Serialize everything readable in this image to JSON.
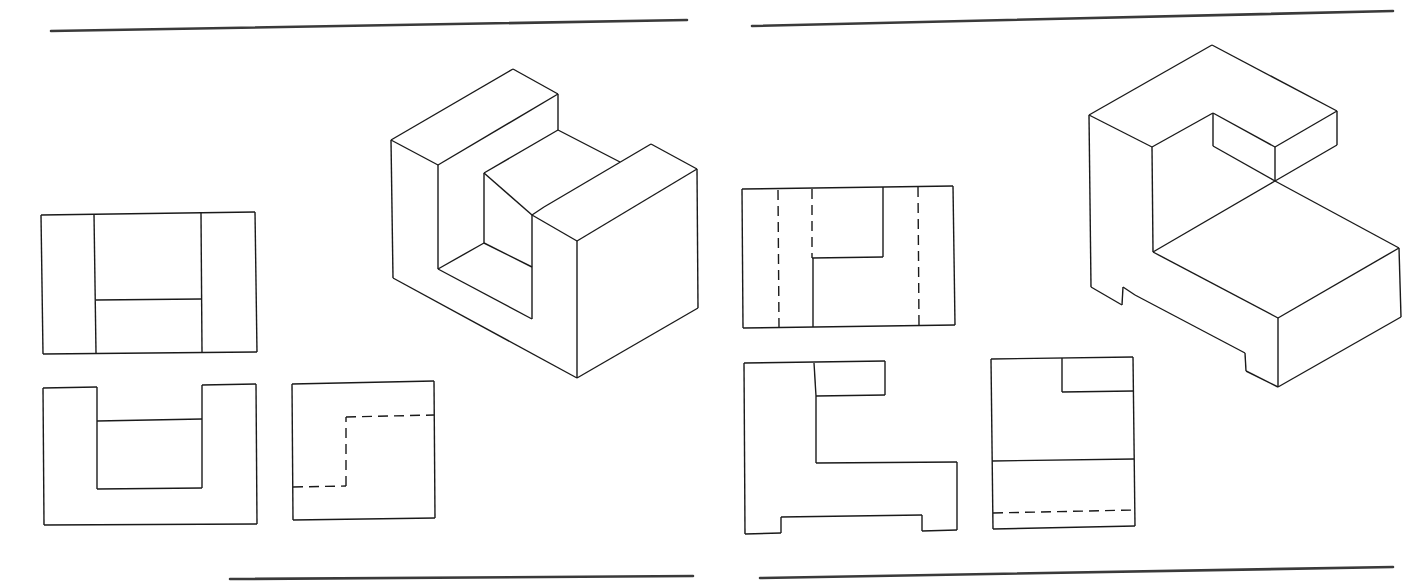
{
  "page": {
    "background": "#ffffff",
    "line_color": "#1a1a1a",
    "rule_color": "#3a3a3a"
  },
  "diagram": {
    "panels": [
      {
        "id": "left",
        "label": "Object 1 (U-shaped block)",
        "rules": {
          "top": {
            "x1": 51,
            "y1": 31,
            "x2": 687,
            "y2": 20
          },
          "bottom": {
            "x1": 230,
            "y1": 579,
            "x2": 693,
            "y2": 576
          }
        },
        "isometric": {
          "label": "Isometric view",
          "edges": [
            [
              391,
              140,
              513,
              69
            ],
            [
              513,
              69,
              558,
              94
            ],
            [
              558,
              94,
              438,
              165
            ],
            [
              438,
              165,
              391,
              140
            ],
            [
              391,
              140,
              393,
              278
            ],
            [
              438,
              165,
              438,
              269
            ],
            [
              558,
              94,
              558,
              130
            ],
            [
              558,
              130,
              484,
              173
            ],
            [
              484,
              173,
              484,
              243
            ],
            [
              558,
              130,
              620,
              162
            ],
            [
              484,
              173,
              532,
              215
            ],
            [
              532,
              215,
              544,
              207
            ],
            [
              544,
              207,
              651,
              144
            ],
            [
              651,
              144,
              697,
              169
            ],
            [
              697,
              169,
              577,
              241
            ],
            [
              577,
              241,
              532,
              215
            ],
            [
              697,
              169,
              698,
              308
            ],
            [
              698,
              308,
              577,
              378
            ],
            [
              577,
              378,
              577,
              241
            ],
            [
              577,
              378,
              393,
              278
            ],
            [
              532,
              215,
              532,
              319
            ],
            [
              438,
              269,
              484,
              243
            ],
            [
              484,
              243,
              532,
              267
            ],
            [
              438,
              269,
              532,
              319
            ]
          ],
          "hidden_edges": []
        },
        "views": [
          {
            "name": "top-view",
            "label": "Top view",
            "edges": [
              [
                41,
                215,
                255,
                212
              ],
              [
                255,
                212,
                257,
                352
              ],
              [
                257,
                352,
                43,
                354
              ],
              [
                43,
                354,
                41,
                215
              ],
              [
                94,
                214,
                96,
                353
              ],
              [
                201,
                213,
                202,
                352
              ],
              [
                96,
                300,
                201,
                299
              ]
            ],
            "hidden_edges": []
          },
          {
            "name": "front-view",
            "label": "Front view",
            "edges": [
              [
                43,
                388,
                97,
                387
              ],
              [
                97,
                387,
                97,
                489
              ],
              [
                97,
                489,
                202,
                488
              ],
              [
                202,
                488,
                202,
                385
              ],
              [
                202,
                385,
                256,
                384
              ],
              [
                256,
                384,
                257,
                524
              ],
              [
                257,
                524,
                44,
                525
              ],
              [
                44,
                525,
                43,
                388
              ],
              [
                97,
                421,
                202,
                419
              ]
            ],
            "hidden_edges": []
          },
          {
            "name": "side-view",
            "label": "Right side view",
            "edges": [
              [
                292,
                384,
                434,
                381
              ],
              [
                434,
                381,
                435,
                518
              ],
              [
                435,
                518,
                293,
                520
              ],
              [
                293,
                520,
                292,
                384
              ]
            ],
            "hidden_edges": [
              [
                293,
                487,
                346,
                486
              ],
              [
                346,
                486,
                346,
                417
              ],
              [
                346,
                417,
                434,
                415
              ]
            ]
          }
        ]
      },
      {
        "id": "right",
        "label": "Object 2 (L-shaped block with base notches)",
        "rules": {
          "top": {
            "x1": 752,
            "y1": 26,
            "x2": 1393,
            "y2": 11
          },
          "bottom": {
            "x1": 760,
            "y1": 578,
            "x2": 1393,
            "y2": 567
          }
        },
        "isometric": {
          "label": "Isometric view",
          "edges": [
            [
              1089,
              115,
              1212,
              45
            ],
            [
              1212,
              45,
              1337,
              111
            ],
            [
              1337,
              111,
              1275,
              147
            ],
            [
              1275,
              147,
              1213,
              113
            ],
            [
              1213,
              113,
              1152,
              147
            ],
            [
              1152,
              147,
              1089,
              115
            ],
            [
              1213,
              113,
              1213,
              146
            ],
            [
              1213,
              146,
              1275,
              181
            ],
            [
              1275,
              147,
              1275,
              181
            ],
            [
              1337,
              111,
              1337,
              145
            ],
            [
              1337,
              145,
              1275,
              181
            ],
            [
              1152,
              147,
              1153,
              252
            ],
            [
              1153,
              252,
              1275,
              181
            ],
            [
              1275,
              181,
              1399,
              248
            ],
            [
              1399,
              248,
              1278,
              318
            ],
            [
              1278,
              318,
              1153,
              252
            ],
            [
              1399,
              248,
              1401,
              317
            ],
            [
              1401,
              317,
              1278,
              387
            ],
            [
              1278,
              318,
              1278,
              387
            ],
            [
              1089,
              115,
              1091,
              287
            ],
            [
              1091,
              287,
              1122,
              305
            ],
            [
              1122,
              305,
              1123,
              287
            ],
            [
              1123,
              287,
              1135,
              295
            ],
            [
              1135,
              295,
              1245,
              353
            ],
            [
              1245,
              353,
              1246,
              371
            ],
            [
              1246,
              371,
              1278,
              387
            ]
          ],
          "hidden_edges": []
        },
        "views": [
          {
            "name": "top-view",
            "label": "Top view",
            "edges": [
              [
                742,
                189,
                953,
                186
              ],
              [
                953,
                186,
                955,
                325
              ],
              [
                955,
                325,
                743,
                328
              ],
              [
                743,
                328,
                742,
                189
              ],
              [
                812,
                258,
                883,
                257
              ],
              [
                883,
                257,
                883,
                187
              ],
              [
                813,
                258,
                813,
                327
              ]
            ],
            "hidden_edges": [
              [
                778,
                190,
                779,
                327
              ],
              [
                812,
                189,
                812,
                258
              ],
              [
                918,
                187,
                919,
                325
              ]
            ]
          },
          {
            "name": "front-view",
            "label": "Front view",
            "edges": [
              [
                744,
                363,
                885,
                361
              ],
              [
                885,
                361,
                885,
                395
              ],
              [
                885,
                395,
                816,
                396
              ],
              [
                816,
                396,
                816,
                463
              ],
              [
                816,
                463,
                957,
                462
              ],
              [
                957,
                462,
                957,
                530
              ],
              [
                957,
                530,
                922,
                531
              ],
              [
                922,
                531,
                922,
                515
              ],
              [
                922,
                515,
                781,
                517
              ],
              [
                781,
                517,
                781,
                533
              ],
              [
                781,
                533,
                745,
                534
              ],
              [
                745,
                534,
                744,
                363
              ],
              [
                814,
                363,
                816,
                396
              ]
            ],
            "hidden_edges": []
          },
          {
            "name": "side-view",
            "label": "Right side view",
            "edges": [
              [
                991,
                359,
                1133,
                357
              ],
              [
                1133,
                357,
                1135,
                526
              ],
              [
                1135,
                526,
                993,
                529
              ],
              [
                993,
                529,
                991,
                359
              ],
              [
                1062,
                358,
                1062,
                392
              ],
              [
                1062,
                392,
                1133,
                391
              ],
              [
                992,
                461,
                1134,
                459
              ]
            ],
            "hidden_edges": [
              [
                993,
                513,
                1135,
                510
              ]
            ]
          }
        ]
      }
    ]
  }
}
